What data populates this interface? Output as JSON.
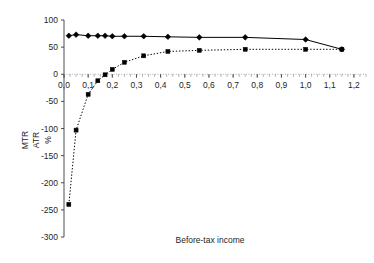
{
  "chart_data": {
    "type": "line",
    "title": "",
    "subtitle": "",
    "xlabel": "Before-tax income",
    "ylabel": "MTR  ATR  %",
    "ylabel_parts": [
      "MTR",
      "ATR",
      "%"
    ],
    "xlim": [
      0.0,
      1.25
    ],
    "ylim": [
      -300,
      100
    ],
    "grid": false,
    "legend_position": "none",
    "x_tick_labels": [
      "0,0",
      "0,1",
      "0,2",
      "0,3",
      "0,4",
      "0,5",
      "0,6",
      "0,7",
      "0,8",
      "0,9",
      "1,0",
      "1,1",
      "1,2"
    ],
    "x_tick_values": [
      0.0,
      0.1,
      0.2,
      0.3,
      0.4,
      0.5,
      0.6,
      0.7,
      0.8,
      0.9,
      1.0,
      1.1,
      1.2
    ],
    "y_tick_labels": [
      "100",
      "50",
      "0",
      "-50",
      "-100",
      "-150",
      "-200",
      "-250",
      "-300"
    ],
    "y_tick_values": [
      100,
      50,
      0,
      -50,
      -100,
      -150,
      -200,
      -250,
      -300
    ],
    "decimal_separator": ",",
    "axis_zero_line_y": 0,
    "series": [
      {
        "name": "MTR",
        "marker": "diamond",
        "linestyle": "solid",
        "color": "#000000",
        "x": [
          0.02,
          0.05,
          0.1,
          0.14,
          0.17,
          0.2,
          0.25,
          0.33,
          0.43,
          0.56,
          0.75,
          1.0,
          1.15
        ],
        "values": [
          71,
          73,
          71,
          71,
          71,
          70,
          70,
          70,
          69,
          68,
          68,
          64,
          46
        ]
      },
      {
        "name": "ATR",
        "marker": "square",
        "linestyle": "dotted",
        "color": "#000000",
        "x": [
          0.02,
          0.05,
          0.1,
          0.14,
          0.17,
          0.2,
          0.25,
          0.33,
          0.43,
          0.56,
          0.75,
          1.0,
          1.15
        ],
        "values": [
          -240,
          -103,
          -37,
          -12,
          -1,
          9,
          22,
          34,
          42,
          44,
          46,
          46,
          46
        ]
      }
    ]
  },
  "axis": {
    "x_title": "Before-tax income",
    "y_rot_1": "MTR",
    "y_rot_2": "ATR",
    "y_rot_3": "%"
  }
}
